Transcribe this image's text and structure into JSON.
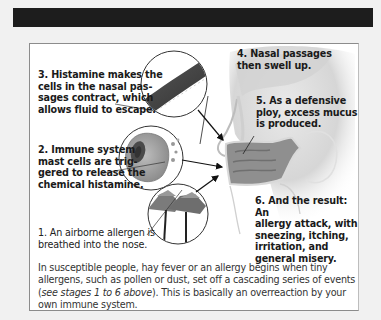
{
  "header_bar": {
    "color": "#1d1d1d"
  },
  "diagram": {
    "title_region": "Allergy / hay fever stages",
    "stages": [
      {
        "number": "1",
        "text": "1. An airborne allergen is breathed into the nose.",
        "lines": [
          "1. An airborne allergen is",
          "breathed into the nose."
        ]
      },
      {
        "number": "2",
        "text": "2. Immune system mast cells are triggered to release the chemical histamine.",
        "lines": [
          "2. Immune system",
          "mast cells are trig-",
          "gered to release the",
          "chemical histamine."
        ]
      },
      {
        "number": "3",
        "text": "3. Histamine makes the cells in the nasal passages contract, which allows fluid to escape.",
        "lines": [
          "3. Histamine makes the",
          "cells in the nasal pas-",
          "sages contract, which",
          "allows fluid to escape."
        ]
      },
      {
        "number": "4",
        "text": "4. Nasal passages then swell up.",
        "lines": [
          "4. Nasal passages",
          "then swell up."
        ]
      },
      {
        "number": "5",
        "text": "5. As a defensive ploy, excess mucus is produced.",
        "lines": [
          "5. As a defensive",
          "ploy, excess mucus",
          "is produced."
        ]
      },
      {
        "number": "6",
        "text": "6. And the result: An allergy attack, with sneezing, itching, irritation, and general misery.",
        "lines": [
          "6. And the result: An",
          "allergy attack, with",
          "sneezing, itching,",
          "irritation, and",
          "general misery."
        ]
      }
    ],
    "illustrations": [
      {
        "name": "nasal-cells-closeup",
        "description": "magnified nasal passage cell tissue"
      },
      {
        "name": "mast-cell-closeup",
        "description": "mast cell releasing histamine granules"
      },
      {
        "name": "pollen-flowers-closeup",
        "description": "daisy-like flowers releasing pollen"
      },
      {
        "name": "head-cross-section",
        "description": "side view of nose and nasal cavity"
      }
    ],
    "caption": {
      "part1": "In susceptible people, hay fever or an allergy begins when tiny allergens, such as pollen or dust, set off a cascading series of events (",
      "italic": "see stages 1 to 6 above",
      "part2": "). This is basically an overreaction by your own immune system."
    }
  }
}
